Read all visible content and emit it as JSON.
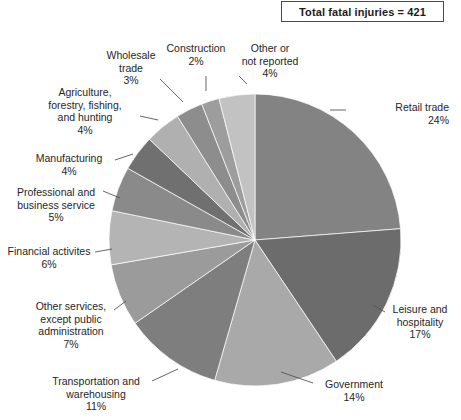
{
  "header": {
    "total_label": "Total fatal injuries = 421"
  },
  "chart_data": {
    "type": "pie",
    "title": "Total fatal injuries = 421",
    "total": 421,
    "units": "percent",
    "start_angle_deg": 0,
    "direction": "clockwise",
    "legend_position": "none",
    "labels_position": "outside-with-leader-lines",
    "categories": [
      "Retail trade",
      "Leisure and hospitality",
      "Government",
      "Transportation and warehousing",
      "Other services, except public administration",
      "Financial activites",
      "Professional and business service",
      "Manufacturing",
      "Agriculture, forestry, fishing, and hunting",
      "Wholesale trade",
      "Construction",
      "Other or not reported"
    ],
    "values": [
      24,
      17,
      14,
      11,
      7,
      6,
      5,
      4,
      4,
      3,
      2,
      4
    ],
    "colors": [
      "#838383",
      "#6c6c6c",
      "#a9a9a9",
      "#7e7e7e",
      "#9b9b9b",
      "#b4b4b4",
      "#8a8a8a",
      "#707070",
      "#b0b0b0",
      "#8d8d8d",
      "#9d9d9d",
      "#c2c2c2"
    ],
    "slices": [
      {
        "label": "Retail trade",
        "value": 24,
        "percent_text": "24%",
        "color": "#838383"
      },
      {
        "label": "Leisure and hospitality",
        "value": 17,
        "percent_text": "17%",
        "color": "#6c6c6c"
      },
      {
        "label": "Government",
        "value": 14,
        "percent_text": "14%",
        "color": "#a9a9a9"
      },
      {
        "label": "Transportation and warehousing",
        "value": 11,
        "percent_text": "11%",
        "color": "#7e7e7e"
      },
      {
        "label": "Other services, except public administration",
        "value": 7,
        "percent_text": "7%",
        "color": "#9b9b9b"
      },
      {
        "label": "Financial activites",
        "value": 6,
        "percent_text": "6%",
        "color": "#b4b4b4"
      },
      {
        "label": "Professional and business service",
        "value": 5,
        "percent_text": "5%",
        "color": "#8a8a8a"
      },
      {
        "label": "Manufacturing",
        "value": 4,
        "percent_text": "4%",
        "color": "#707070"
      },
      {
        "label": "Agriculture, forestry, fishing, and hunting",
        "value": 4,
        "percent_text": "4%",
        "color": "#b0b0b0"
      },
      {
        "label": "Wholesale trade",
        "value": 3,
        "percent_text": "3%",
        "color": "#8d8d8d"
      },
      {
        "label": "Construction",
        "value": 2,
        "percent_text": "2%",
        "color": "#9d9d9d"
      },
      {
        "label": "Other or not reported",
        "value": 4,
        "percent_text": "4%",
        "color": "#c2c2c2"
      }
    ]
  },
  "labels": {
    "retail_trade": "Retail trade\n24%",
    "leisure_hospitality": "Leisure and\nhospitality\n17%",
    "government": "Government\n14%",
    "transportation_warehousing": "Transportation and\nwarehousing\n11%",
    "other_services": "Other services,\nexcept public\nadministration\n7%",
    "financial_activities": "Financial activites\n6%",
    "professional_business": "Professional and\nbusiness service\n5%",
    "manufacturing": "Manufacturing\n4%",
    "agriculture": "Agriculture,\nforestry, fishing,\nand hunting\n4%",
    "wholesale_trade": "Wholesale\ntrade\n3%",
    "construction": "Construction\n2%",
    "other_not_reported": "Other or\nnot reported\n4%"
  }
}
